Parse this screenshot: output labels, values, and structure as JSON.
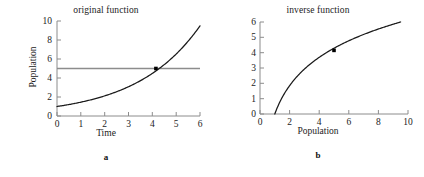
{
  "figure": {
    "panels": [
      {
        "caption": "a",
        "title": "original function",
        "xlabel": "Time",
        "ylabel": "Population"
      },
      {
        "caption": "b",
        "title": "inverse function",
        "xlabel": "Population",
        "ylabel": "Time"
      }
    ],
    "colors": {
      "curve": "#1a1a1a",
      "reference_line": "#8c8c8c",
      "axis": "#8c8c8c",
      "marker": "#000000",
      "text": "#222222",
      "background": "#ffffff"
    }
  },
  "chart_data": [
    {
      "type": "line",
      "title": "original function",
      "xlabel": "Time",
      "ylabel": "Population",
      "xlim": [
        0,
        6
      ],
      "ylim": [
        0,
        10
      ],
      "xticks": [
        0,
        1,
        2,
        3,
        4,
        5,
        6
      ],
      "yticks": [
        0,
        2,
        4,
        6,
        8,
        10
      ],
      "xticklabels": [
        "0",
        "1",
        "2",
        "3",
        "4",
        "5",
        "6"
      ],
      "yticklabels": [
        "0",
        "2",
        "4",
        "6",
        "8",
        "10"
      ],
      "grid": false,
      "legend": "none",
      "series": [
        {
          "name": "exponential growth",
          "kind": "curve",
          "equation": "Population = e^(0.375 * Time)",
          "x": [
            0,
            0.5,
            1,
            1.5,
            2,
            2.5,
            3,
            3.5,
            4,
            4.5,
            5,
            5.5,
            6
          ],
          "values": [
            1.0,
            1.21,
            1.45,
            1.75,
            2.12,
            2.56,
            3.08,
            3.72,
            4.48,
            5.41,
            6.52,
            7.87,
            9.49
          ]
        },
        {
          "name": "reference line at Population = 5",
          "kind": "horizontal-line",
          "y": 5,
          "x": [
            0,
            6
          ]
        }
      ],
      "annotations": [
        {
          "kind": "point-marker",
          "x": 4.15,
          "y": 5,
          "label": "intersection"
        }
      ]
    },
    {
      "type": "line",
      "title": "inverse function",
      "xlabel": "Population",
      "ylabel": "Time",
      "xlim": [
        0,
        10
      ],
      "ylim": [
        0,
        6
      ],
      "xticks": [
        0,
        2,
        4,
        6,
        8,
        10
      ],
      "yticks": [
        0,
        1,
        2,
        3,
        4,
        5,
        6
      ],
      "xticklabels": [
        "0",
        "2",
        "4",
        "6",
        "8",
        "10"
      ],
      "yticklabels": [
        "0",
        "1",
        "2",
        "3",
        "4",
        "5",
        "6"
      ],
      "grid": false,
      "legend": "none",
      "series": [
        {
          "name": "logarithmic inverse",
          "kind": "curve",
          "equation": "Time = ln(Population) / 0.375",
          "x": [
            1.0,
            1.5,
            2,
            2.5,
            3,
            3.5,
            4,
            5,
            6,
            7,
            8,
            9,
            9.5
          ],
          "values": [
            0.0,
            1.08,
            1.85,
            2.44,
            2.93,
            3.34,
            3.7,
            4.29,
            4.78,
            5.19,
            5.55,
            5.86,
            6.0
          ]
        }
      ],
      "annotations": [
        {
          "kind": "point-marker",
          "x": 5,
          "y": 4.15,
          "label": "corresponding point"
        }
      ]
    }
  ]
}
